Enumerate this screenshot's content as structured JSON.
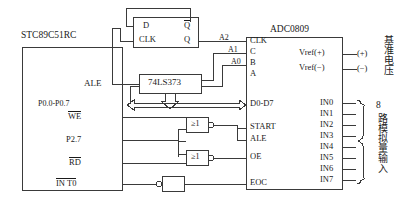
{
  "diagram": {
    "mcu": {
      "name": "STC89C51RC",
      "pins": {
        "ale": "ALE",
        "p0": "P0.0-P0.7",
        "we": "WE",
        "p27": "P2.7",
        "rd": "RD",
        "int0": "IN T0"
      }
    },
    "flipflop": {
      "d": "D",
      "clk": "CLK",
      "qbar": "Q",
      "q": "Q"
    },
    "latch": {
      "name": "74LS373"
    },
    "address_labels": {
      "a2": "A2",
      "a1": "A1",
      "a0": "A0"
    },
    "gates": {
      "nor1": "≥1",
      "nor2": "≥1"
    },
    "adc": {
      "name": "ADC0809",
      "left_pins": [
        "CLK",
        "C",
        "B",
        "A",
        "D0-D7",
        "START",
        "ALE",
        "OE",
        "EOC"
      ],
      "right_pins": [
        "Vref(+)",
        "Vref(−)",
        "IN0",
        "IN1",
        "IN2",
        "IN3",
        "IN4",
        "IN5",
        "IN6",
        "IN7"
      ]
    },
    "terminals": {
      "vref_plus": "(+)",
      "vref_minus": "(−)"
    },
    "annotations": {
      "vref_cn": "基准电压",
      "analog_in_count": "8",
      "analog_in_cn": "路模拟量输入"
    },
    "colors": {
      "line": "#3a3a3a",
      "text": "#1a1a1a",
      "background": "#ffffff"
    }
  }
}
